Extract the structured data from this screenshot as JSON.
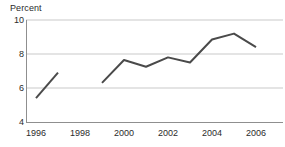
{
  "chart_data": {
    "type": "line",
    "title": "",
    "ylabel": "Percent",
    "xlabel": "",
    "ylim": [
      4,
      10
    ],
    "xlim": [
      1995.5,
      2006.5
    ],
    "grid": true,
    "gridlines_y": [
      6,
      8,
      10
    ],
    "legend": "none",
    "yticks": [
      "4",
      "6",
      "8",
      "10"
    ],
    "ytick_values": [
      4,
      6,
      8,
      10
    ],
    "xticks": [
      "1996",
      "1998",
      "2000",
      "2002",
      "2004",
      "2006"
    ],
    "xtick_values": [
      1996,
      1998,
      2000,
      2002,
      2004,
      2006
    ],
    "line_color": "#4a4a4a",
    "axis_color": "#8f8f8f",
    "grid_color": "#c9c9c9",
    "series": [
      {
        "name": "segment-1",
        "x": [
          1996,
          1997
        ],
        "values": [
          5.4,
          6.9
        ]
      },
      {
        "name": "segment-2",
        "x": [
          1999,
          2000,
          2001,
          2002,
          2003,
          2004,
          2005,
          2006
        ],
        "values": [
          6.3,
          7.65,
          7.25,
          7.8,
          7.5,
          8.85,
          9.2,
          8.4
        ]
      }
    ]
  }
}
